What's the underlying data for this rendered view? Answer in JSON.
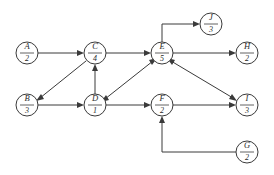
{
  "diagram": {
    "background_color": "#ffffff",
    "line_color": "#3a3a3a",
    "node_fill": "#ffffff",
    "node_radius": 11,
    "nodes": [
      {
        "id": "A",
        "letter": "A",
        "number": "2",
        "cx": 27,
        "cy": 53
      },
      {
        "id": "B",
        "letter": "B",
        "number": "3",
        "cx": 27,
        "cy": 105
      },
      {
        "id": "C",
        "letter": "C",
        "number": "4",
        "cx": 95,
        "cy": 53
      },
      {
        "id": "D",
        "letter": "D",
        "number": "1",
        "cx": 95,
        "cy": 105
      },
      {
        "id": "E",
        "letter": "E",
        "number": "5",
        "cx": 162,
        "cy": 53
      },
      {
        "id": "F",
        "letter": "F",
        "number": "2",
        "cx": 162,
        "cy": 105
      },
      {
        "id": "J",
        "letter": "J",
        "number": "3",
        "cx": 211,
        "cy": 24
      },
      {
        "id": "H",
        "letter": "H",
        "number": "2",
        "cx": 247,
        "cy": 53
      },
      {
        "id": "I",
        "letter": "I",
        "number": "3",
        "cx": 247,
        "cy": 105
      },
      {
        "id": "G",
        "letter": "G",
        "number": "2",
        "cx": 247,
        "cy": 152
      }
    ],
    "edges": [
      {
        "id": "A-C",
        "from": "A",
        "to": "C",
        "kind": "straight"
      },
      {
        "id": "C-B",
        "from": "C",
        "to": "B",
        "kind": "diagonal"
      },
      {
        "id": "B-D",
        "from": "B",
        "to": "D",
        "kind": "straight"
      },
      {
        "id": "D-C",
        "from": "D",
        "to": "C",
        "kind": "vertical"
      },
      {
        "id": "C-E",
        "from": "C",
        "to": "E",
        "kind": "straight"
      },
      {
        "id": "D-E",
        "from": "D",
        "to": "E",
        "kind": "diagonal"
      },
      {
        "id": "E-D",
        "from": "E",
        "to": "D",
        "kind": "diagonal"
      },
      {
        "id": "E-J",
        "from": "E",
        "to": "J",
        "kind": "elbow-up"
      },
      {
        "id": "E-H",
        "from": "E",
        "to": "H",
        "kind": "straight"
      },
      {
        "id": "E-I",
        "from": "E",
        "to": "I",
        "kind": "diagonal"
      },
      {
        "id": "I-E",
        "from": "I",
        "to": "E",
        "kind": "diagonal"
      },
      {
        "id": "D-F",
        "from": "D",
        "to": "F",
        "kind": "straight"
      },
      {
        "id": "F-I",
        "from": "F",
        "to": "I",
        "kind": "straight"
      },
      {
        "id": "G-F",
        "from": "G",
        "to": "F",
        "kind": "elbow-down"
      }
    ]
  }
}
